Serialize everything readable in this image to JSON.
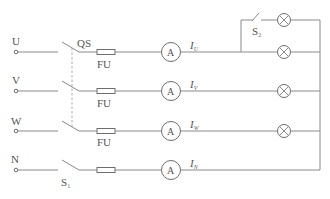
{
  "diagram": {
    "type": "three-phase four-wire lighting circuit",
    "lines": [
      {
        "label": "U",
        "current_label": "I",
        "current_sub": "U",
        "fuse_label": "FU"
      },
      {
        "label": "V",
        "current_label": "I",
        "current_sub": "V",
        "fuse_label": "FU"
      },
      {
        "label": "W",
        "current_label": "I",
        "current_sub": "W",
        "fuse_label": "FU"
      },
      {
        "label": "N",
        "current_label": "I",
        "current_sub": "N"
      }
    ],
    "main_switch_label": "QS",
    "neutral_switch": {
      "label": "S",
      "sub": "1"
    },
    "branch_switch": {
      "label": "S",
      "sub": "2"
    },
    "ammeter_symbol": "A",
    "lamp_count": 4
  }
}
